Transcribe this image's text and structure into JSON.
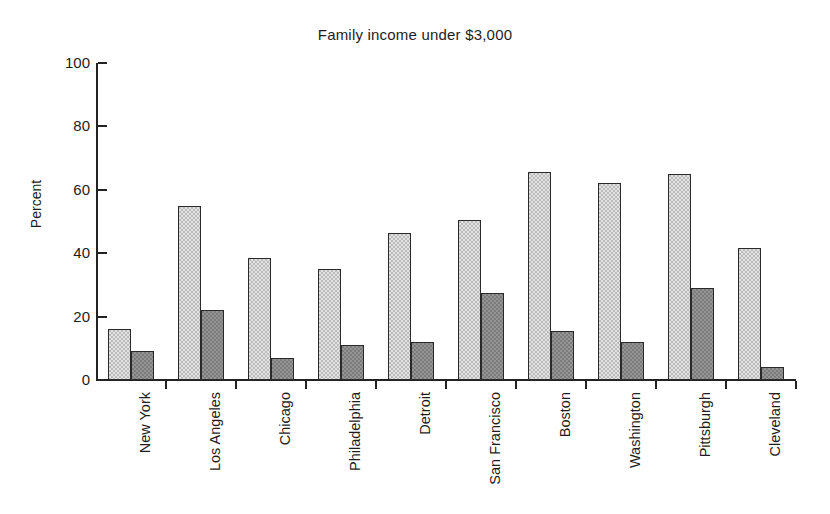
{
  "chart_data": {
    "type": "bar",
    "title": "Family income under $3,000",
    "xlabel": "",
    "ylabel": "Percent",
    "ylim": [
      0,
      100
    ],
    "yticks": [
      0,
      20,
      40,
      60,
      80,
      100
    ],
    "ytick_labels": [
      "0",
      "20",
      "40",
      "60",
      "80",
      "100"
    ],
    "grid": false,
    "legend": "none",
    "categories": [
      "New York",
      "Los Angeles",
      "Chicago",
      "Philadelphia",
      "Detroit",
      "San Francisco",
      "Boston",
      "Washington",
      "Pittsburgh",
      "Cleveland"
    ],
    "series": [
      {
        "name": "light",
        "color": "#bcbcbc",
        "values": [
          16,
          55,
          38.5,
          35,
          46.5,
          50.5,
          65.5,
          62,
          65,
          41.5
        ]
      },
      {
        "name": "dark",
        "color": "#7c7c7c",
        "values": [
          9,
          22,
          7,
          11,
          12,
          27.5,
          15.5,
          12,
          29,
          4
        ]
      }
    ]
  }
}
